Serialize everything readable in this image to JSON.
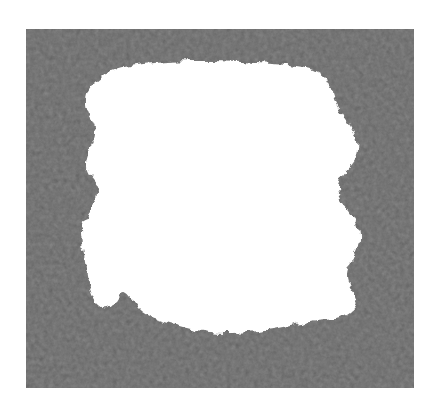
{
  "image": {
    "kind": "segmentation-mask",
    "title": "Binary segmentation mask over noisy grayscale texture",
    "width": 439,
    "height": 413,
    "background_color": "#ffffff"
  },
  "noise_region": {
    "label": "noisy gray background texture",
    "x": 26,
    "y": 29,
    "width": 388,
    "height": 359,
    "base_color": "#8a8a8a",
    "light_color": "#b4b4b4",
    "dark_color": "#5a5a5a",
    "mean_gray_level": 138,
    "texture": "fine-grained speckle noise"
  },
  "foreground_blob": {
    "label": "segmented white foreground region",
    "fill_color": "#ffffff",
    "edge_style": "irregular scalloped",
    "bounding_box": {
      "x": 78,
      "y": 58,
      "width": 290,
      "height": 276
    },
    "outline_points": [
      [
        96,
        82
      ],
      [
        112,
        71
      ],
      [
        136,
        65
      ],
      [
        168,
        62
      ],
      [
        205,
        61
      ],
      [
        240,
        62
      ],
      [
        272,
        64
      ],
      [
        296,
        66
      ],
      [
        314,
        70
      ],
      [
        326,
        78
      ],
      [
        331,
        90
      ],
      [
        336,
        104
      ],
      [
        344,
        116
      ],
      [
        352,
        128
      ],
      [
        357,
        142
      ],
      [
        356,
        156
      ],
      [
        349,
        166
      ],
      [
        341,
        176
      ],
      [
        338,
        188
      ],
      [
        341,
        200
      ],
      [
        349,
        210
      ],
      [
        356,
        222
      ],
      [
        359,
        236
      ],
      [
        357,
        250
      ],
      [
        350,
        262
      ],
      [
        346,
        274
      ],
      [
        349,
        286
      ],
      [
        355,
        296
      ],
      [
        356,
        306
      ],
      [
        348,
        314
      ],
      [
        334,
        318
      ],
      [
        316,
        320
      ],
      [
        296,
        324
      ],
      [
        272,
        329
      ],
      [
        248,
        332
      ],
      [
        224,
        333
      ],
      [
        202,
        331
      ],
      [
        182,
        327
      ],
      [
        164,
        322
      ],
      [
        148,
        316
      ],
      [
        138,
        308
      ],
      [
        131,
        298
      ],
      [
        124,
        292
      ],
      [
        117,
        297
      ],
      [
        112,
        305
      ],
      [
        104,
        307
      ],
      [
        96,
        301
      ],
      [
        91,
        290
      ],
      [
        88,
        276
      ],
      [
        86,
        262
      ],
      [
        84,
        248
      ],
      [
        82,
        234
      ],
      [
        84,
        222
      ],
      [
        90,
        212
      ],
      [
        96,
        203
      ],
      [
        99,
        194
      ],
      [
        96,
        184
      ],
      [
        90,
        176
      ],
      [
        86,
        166
      ],
      [
        88,
        154
      ],
      [
        93,
        144
      ],
      [
        96,
        134
      ],
      [
        94,
        124
      ],
      [
        89,
        114
      ],
      [
        86,
        103
      ],
      [
        88,
        92
      ]
    ],
    "notches": [
      {
        "name": "left-mid-indent",
        "x": 99,
        "y": 194
      },
      {
        "name": "right-mid-indent",
        "x": 338,
        "y": 188
      },
      {
        "name": "bottom-left-spike",
        "x": 124,
        "y": 292
      }
    ]
  }
}
